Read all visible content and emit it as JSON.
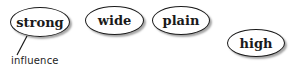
{
  "diagram": {
    "nodes": [
      {
        "id": "strong",
        "label": "strong"
      },
      {
        "id": "wide",
        "label": "wide"
      },
      {
        "id": "plain",
        "label": "plain"
      },
      {
        "id": "high",
        "label": "high"
      }
    ],
    "annotation": {
      "label": "influence",
      "attached_to": "strong"
    }
  }
}
